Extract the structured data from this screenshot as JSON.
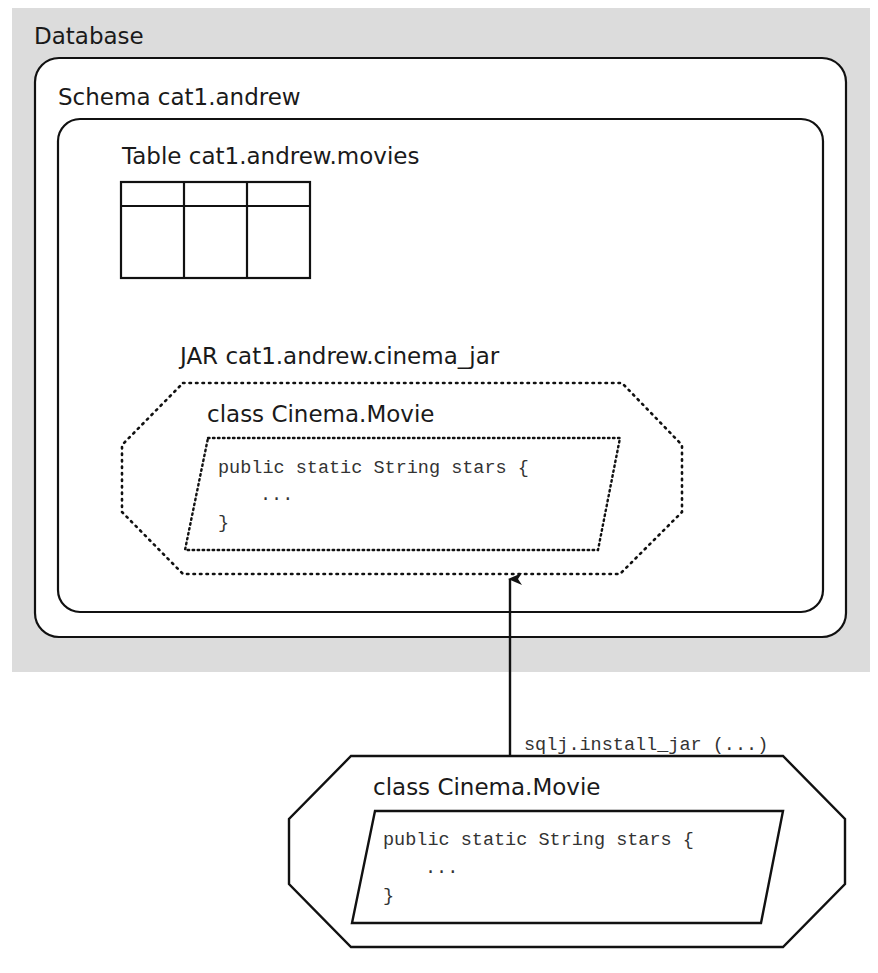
{
  "colors": {
    "database_fill": "#dcdcdc",
    "box_fill": "#ffffff",
    "stroke": "#111111"
  },
  "database": {
    "label": "Database"
  },
  "schema": {
    "label": "Schema cat1.andrew"
  },
  "table": {
    "label": "Table cat1.andrew.movies",
    "columns": 3,
    "rows": 1
  },
  "jar": {
    "label": "JAR cat1.andrew.cinema_jar",
    "class_label": "class Cinema.Movie",
    "code": {
      "line1": "public static String stars {",
      "line2": "...",
      "line3": "}"
    }
  },
  "arrow": {
    "label": "sqlj.install_jar (...)"
  },
  "external_class": {
    "class_label": "class Cinema.Movie",
    "code": {
      "line1": "public static String stars {",
      "line2": "...",
      "line3": "}"
    }
  }
}
